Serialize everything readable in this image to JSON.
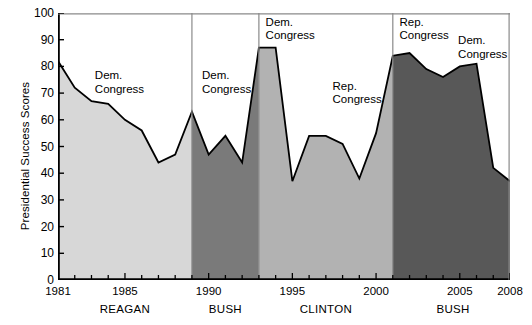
{
  "chart_data": {
    "type": "area",
    "title": "",
    "xlabel": "",
    "ylabel": "Presidential Success Scores",
    "ylim": [
      0,
      100
    ],
    "xlim": [
      1981,
      2008
    ],
    "ytick_labels": [
      "100",
      "90",
      "80",
      "70",
      "60",
      "50",
      "40",
      "30",
      "20",
      "10",
      "0"
    ],
    "ytick_values": [
      100,
      90,
      80,
      70,
      60,
      50,
      40,
      30,
      20,
      10,
      0
    ],
    "xtick_labels": [
      "1981",
      "1985",
      "1990",
      "1995",
      "2000",
      "2005",
      "2008"
    ],
    "xtick_values": [
      1981,
      1985,
      1990,
      1995,
      2000,
      2005,
      2008
    ],
    "grid": false,
    "legend": "none",
    "x": [
      1981,
      1982,
      1983,
      1984,
      1985,
      1986,
      1987,
      1988,
      1989,
      1990,
      1991,
      1992,
      1993,
      1994,
      1995,
      1996,
      1997,
      1998,
      1999,
      2000,
      2001,
      2002,
      2003,
      2004,
      2005,
      2006,
      2007,
      2008
    ],
    "values": [
      82,
      72,
      67,
      66,
      60,
      56,
      44,
      47,
      63,
      47,
      54,
      44,
      87,
      87,
      37,
      54,
      54,
      51,
      38,
      55,
      84,
      85,
      79,
      76,
      80,
      81,
      42,
      37
    ],
    "series": [
      {
        "name": "Presidential Success Score",
        "values": [
          82,
          72,
          67,
          66,
          60,
          56,
          44,
          47,
          63,
          47,
          54,
          44,
          87,
          87,
          37,
          54,
          54,
          51,
          38,
          55,
          84,
          85,
          79,
          76,
          80,
          81,
          42,
          37
        ]
      }
    ],
    "eras": [
      {
        "president": "REAGAN",
        "start": 1981,
        "end": 1989,
        "fill": "#d7d7d7",
        "label_x": 1985.0
      },
      {
        "president": "BUSH",
        "start": 1989,
        "end": 1993,
        "fill": "#7a7a7a",
        "label_x": 1991.0
      },
      {
        "president": "CLINTON",
        "start": 1993,
        "end": 2001,
        "fill": "#b2b2b2",
        "label_x": 1997.0
      },
      {
        "president": "BUSH",
        "start": 2001,
        "end": 2008,
        "fill": "#585858",
        "label_x": 2004.6
      }
    ],
    "annotations": [
      {
        "text_line1": "Dem.",
        "text_line2": "Congress",
        "x": 1983.2,
        "y": 79
      },
      {
        "text_line1": "Dem.",
        "text_line2": "Congress",
        "x": 1989.6,
        "y": 79
      },
      {
        "text_line1": "Dem.",
        "text_line2": "Congress",
        "x": 1993.4,
        "y": 99
      },
      {
        "text_line1": "Rep.",
        "text_line2": "Congress",
        "x": 1997.4,
        "y": 75
      },
      {
        "text_line1": "Rep.",
        "text_line2": "Congress",
        "x": 2001.4,
        "y": 99
      },
      {
        "text_line1": "Dem.",
        "text_line2": "Congress",
        "x": 2004.9,
        "y": 92
      }
    ],
    "colors": {
      "reagan_fill": "#d7d7d7",
      "bush41_fill": "#7a7a7a",
      "clinton_fill": "#b2b2b2",
      "bush43_fill": "#585858",
      "line": "#000000",
      "axis": "#000000",
      "divider": "#8a8a8a",
      "background": "#ffffff"
    }
  }
}
